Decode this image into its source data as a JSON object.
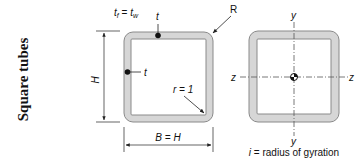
{
  "title": "Square tubes",
  "left_figure": {
    "thickness_relation": {
      "t": "t",
      "f_sub": "f",
      "eq": " = ",
      "w_sub": "w"
    },
    "wall_label_top": "t",
    "wall_label_side": "t",
    "outer_radius_label": "R",
    "inner_radius_label": "r = 1",
    "height_label": "H",
    "width_label": "B = H"
  },
  "right_figure": {
    "axis_y_top": "y",
    "axis_y_bottom": "y",
    "axis_z_left": "z",
    "axis_z_right": "z",
    "caption_var": "i",
    "caption_text": " = radius of gyration"
  },
  "colors": {
    "wall_fill": "#d6d6d6",
    "wall_stroke": "#8a8a8a",
    "line": "#222222",
    "axis": "#555555"
  }
}
